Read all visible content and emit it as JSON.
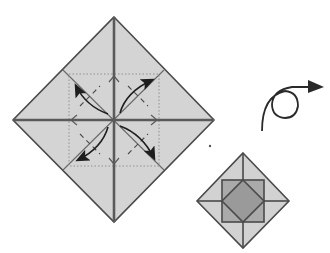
{
  "diagram": {
    "type": "origami-fold-step",
    "colors": {
      "background": "#ffffff",
      "paper": "#d4d4d4",
      "crease": "#5a5a5a",
      "outline": "#4a4a4a",
      "arrow": "#1e1e1e",
      "result_square": "#aaaaaa",
      "result_center": "#9a9a9a",
      "dotted_guide": "#8a8a8a"
    },
    "main_diagram": {
      "shape": "diamond",
      "vertices": {
        "top": [
          114,
          17
        ],
        "right": [
          214,
          120
        ],
        "bottom": [
          114,
          222
        ],
        "left": [
          13,
          120
        ]
      },
      "center": [
        114,
        120
      ],
      "creases": [
        "vertical-valley",
        "horizontal-valley",
        "diagonal-left",
        "diagonal-right"
      ],
      "dotted_square": {
        "x": 69,
        "y": 74,
        "width": 90,
        "height": 92
      },
      "fold_arrows": [
        "upper-left",
        "upper-right",
        "lower-left",
        "lower-right"
      ],
      "instruction": "Fold the four corners to the center (blintz fold)"
    },
    "turn_over_symbol": {
      "meaning": "turn over",
      "circle_center": [
        285,
        105
      ],
      "circle_radius": 13
    },
    "result_diagram": {
      "shape": "diamond",
      "vertices": {
        "top": [
          243,
          153
        ],
        "right": [
          289,
          201
        ],
        "bottom": [
          243,
          248
        ],
        "left": [
          197,
          201
        ]
      },
      "inner_square": {
        "x": 222,
        "y": 180,
        "width": 42,
        "height": 42
      },
      "inner_diamond": {
        "top": [
          243,
          180
        ],
        "right": [
          264,
          201
        ],
        "bottom": [
          243,
          222
        ],
        "left": [
          222,
          201
        ]
      }
    }
  }
}
